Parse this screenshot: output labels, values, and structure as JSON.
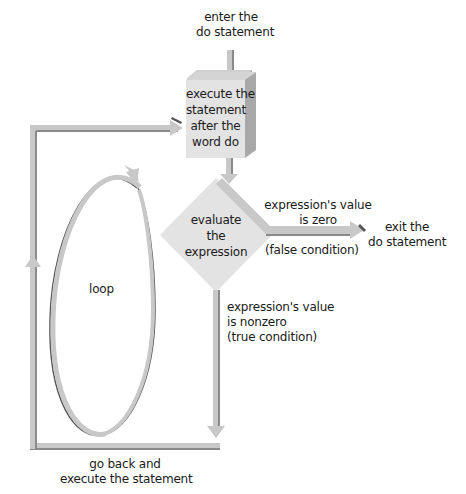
{
  "diagram": {
    "colors": {
      "arrow_fill": "#c8c8c8",
      "arrow_shadow": "#8a8a8a",
      "box_front": "#e2e2e2",
      "box_side": "#a8a8a8",
      "box_top": "#d0d0d0",
      "diamond": "#e2e2e2",
      "loop_dark": "#555555",
      "text": "#1a1a1a"
    },
    "labels": {
      "enter": [
        "enter the",
        "do statement"
      ],
      "process": [
        "execute the",
        "statement",
        "after the",
        "word do"
      ],
      "decision": [
        "evaluate",
        "the",
        "expression"
      ],
      "false_branch_top": [
        "expression's value",
        "is zero"
      ],
      "false_branch_bottom": "(false condition)",
      "exit": [
        "exit the",
        "do statement"
      ],
      "true_branch": [
        "expression's value",
        "is nonzero",
        "(true condition)"
      ],
      "loop": "loop",
      "go_back": [
        "go back and",
        "execute the statement"
      ]
    }
  }
}
